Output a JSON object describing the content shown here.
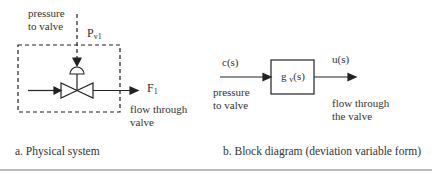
{
  "physical": {
    "input_label_line1": "pressure",
    "input_label_line2": "to valve",
    "signal_symbol": "P",
    "signal_subscript": "v1",
    "output_symbol": "F",
    "output_subscript": "1",
    "output_label_line1": "flow through",
    "output_label_line2": "valve",
    "caption": "a.  Physical system"
  },
  "block": {
    "input_symbol": "c(s)",
    "input_label_line1": "pressure",
    "input_label_line2": "to valve",
    "transfer_fn": "g",
    "transfer_sub": "v",
    "transfer_arg": "(s)",
    "output_symbol": "u(s)",
    "output_label_line1": "flow through",
    "output_label_line2": "the valve",
    "caption": "b.  Block diagram (deviation variable form)"
  },
  "colors": {
    "line": "#222222",
    "rule": "#bbbbbb"
  }
}
